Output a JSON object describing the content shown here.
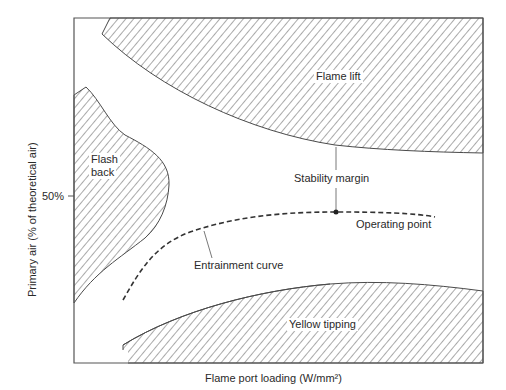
{
  "diagram": {
    "x_axis_label": "Flame port loading (W/mm²)",
    "y_axis_label": "Primary air (% of theoretical air)",
    "y_tick": "50%",
    "regions": {
      "flame_lift": "Flame lift",
      "flash_back_line1": "Flash",
      "flash_back_line2": "back",
      "yellow_tipping": "Yellow tipping"
    },
    "annotations": {
      "stability_margin": "Stability margin",
      "operating_point": "Operating point",
      "entrainment_curve": "Entrainment curve"
    },
    "colors": {
      "line": "#4a4a4a",
      "hatch": "#555555",
      "background": "#ffffff"
    }
  }
}
